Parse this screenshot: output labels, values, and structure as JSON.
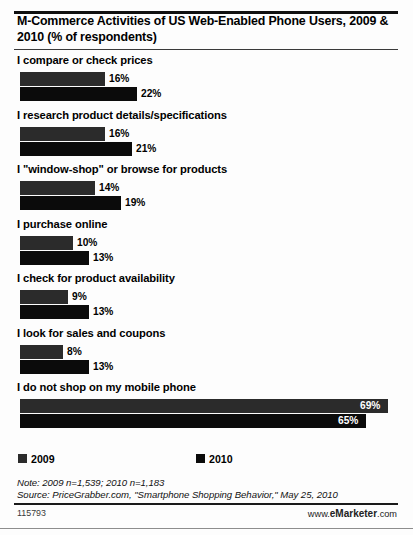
{
  "header": {
    "title": "M-Commerce Activities of US Web-Enabled Phone Users, 2009 & 2010 (% of respondents)"
  },
  "legend": {
    "items": [
      {
        "label": "2009",
        "color": "#2b2b2b",
        "swatch_name": "legend-swatch-2009"
      },
      {
        "label": "2010",
        "color": "#0b0b0b",
        "swatch_name": "legend-swatch-2010"
      }
    ]
  },
  "footer": {
    "note": "Note: 2009 n=1,539; 2010 n=1,183",
    "source": "Source: PriceGrabber.com, \"Smartphone Shopping Behavior,\" May 25, 2010",
    "code": "115793",
    "brand_prefix": "www.",
    "brand_strong": "eMarketer",
    "brand_suffix": ".com"
  },
  "chart_data": {
    "type": "bar",
    "orientation": "horizontal",
    "title": "M-Commerce Activities of US Web-Enabled Phone Users, 2009 & 2010 (% of respondents)",
    "xlabel": "",
    "ylabel": "",
    "unit": "%",
    "xlim": [
      0,
      69
    ],
    "grid": false,
    "legend_position": "bottom",
    "categories": [
      "I compare or check prices",
      "I research product details/specifications",
      "I \"window-shop\" or browse for products",
      "I purchase online",
      "I check for product availability",
      "I look for sales and coupons",
      "I do not shop on my mobile phone"
    ],
    "series": [
      {
        "name": "2009",
        "color": "#2b2b2b",
        "values": [
          16,
          16,
          14,
          10,
          9,
          8,
          69
        ],
        "labels": [
          "16%",
          "16%",
          "14%",
          "10%",
          "9%",
          "8%",
          "69%"
        ]
      },
      {
        "name": "2010",
        "color": "#0b0b0b",
        "values": [
          22,
          21,
          19,
          13,
          13,
          13,
          65
        ],
        "labels": [
          "22%",
          "21%",
          "19%",
          "13%",
          "13%",
          "13%",
          "65%"
        ]
      }
    ]
  }
}
